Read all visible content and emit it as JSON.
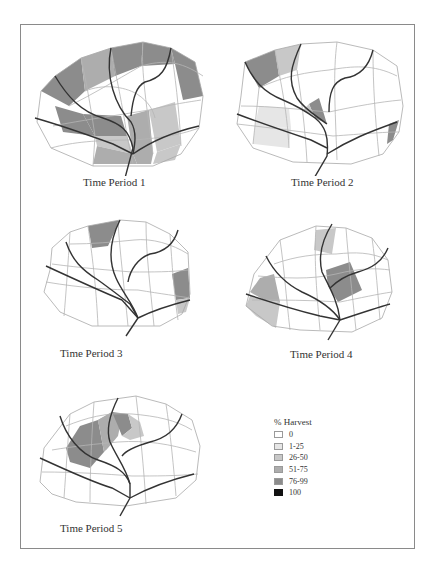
{
  "figure": {
    "legend": {
      "title": "% Harvest",
      "classes": [
        {
          "label": "0",
          "color": "#ffffff"
        },
        {
          "label": "1-25",
          "color": "#e6e6e6"
        },
        {
          "label": "26-50",
          "color": "#c8c8c8"
        },
        {
          "label": "51-75",
          "color": "#adadad"
        },
        {
          "label": "76-99",
          "color": "#8c8c8c"
        },
        {
          "label": "100",
          "color": "#111111"
        }
      ]
    },
    "panels": [
      {
        "caption": "Time Period 1"
      },
      {
        "caption": "Time Period 2"
      },
      {
        "caption": "Time Period 3"
      },
      {
        "caption": "Time Period 4"
      },
      {
        "caption": "Time Period 5"
      }
    ]
  }
}
